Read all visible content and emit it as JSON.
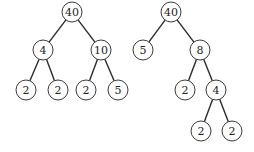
{
  "diagram": {
    "type": "binary-trees",
    "trees": [
      {
        "name": "left-tree",
        "nodes": [
          {
            "id": "L0",
            "label": "40",
            "x": 72,
            "y": 12
          },
          {
            "id": "L1",
            "label": "4",
            "x": 43,
            "y": 50
          },
          {
            "id": "L2",
            "label": "10",
            "x": 101,
            "y": 50
          },
          {
            "id": "L3",
            "label": "2",
            "x": 26,
            "y": 90
          },
          {
            "id": "L4",
            "label": "2",
            "x": 58,
            "y": 90
          },
          {
            "id": "L5",
            "label": "2",
            "x": 86,
            "y": 90
          },
          {
            "id": "L6",
            "label": "5",
            "x": 118,
            "y": 90
          }
        ],
        "edges": [
          [
            "L0",
            "L1"
          ],
          [
            "L0",
            "L2"
          ],
          [
            "L1",
            "L3"
          ],
          [
            "L1",
            "L4"
          ],
          [
            "L2",
            "L5"
          ],
          [
            "L2",
            "L6"
          ]
        ]
      },
      {
        "name": "right-tree",
        "nodes": [
          {
            "id": "R0",
            "label": "40",
            "x": 171,
            "y": 12
          },
          {
            "id": "R1",
            "label": "5",
            "x": 143,
            "y": 50
          },
          {
            "id": "R2",
            "label": "8",
            "x": 200,
            "y": 50
          },
          {
            "id": "R3",
            "label": "2",
            "x": 185,
            "y": 90
          },
          {
            "id": "R4",
            "label": "4",
            "x": 216,
            "y": 90
          },
          {
            "id": "R5",
            "label": "2",
            "x": 201,
            "y": 131
          },
          {
            "id": "R6",
            "label": "2",
            "x": 232,
            "y": 131
          }
        ],
        "edges": [
          [
            "R0",
            "R1"
          ],
          [
            "R0",
            "R2"
          ],
          [
            "R2",
            "R3"
          ],
          [
            "R2",
            "R4"
          ],
          [
            "R4",
            "R5"
          ],
          [
            "R4",
            "R6"
          ]
        ]
      }
    ],
    "node_radius": 10
  }
}
